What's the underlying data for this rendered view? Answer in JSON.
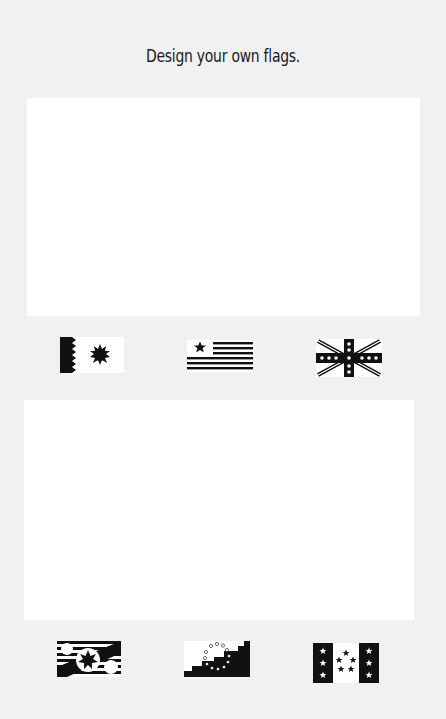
{
  "page": {
    "title": "Design your own flags.",
    "background_color": "#f1f1f1",
    "panel_color": "#ffffff",
    "ink_color": "#111111"
  },
  "panels": [
    {
      "id": "drawing-area-1",
      "label": ""
    },
    {
      "id": "drawing-area-2",
      "label": ""
    }
  ],
  "flags_row1": [
    {
      "name": "serrated-edge-sun-flag",
      "description": "Black serrated hoist with black sunburst"
    },
    {
      "name": "stripes-single-star-flag",
      "description": "Horizontal black stripes with star in canton"
    },
    {
      "name": "union-jack-stars-flag",
      "description": "Saltire cross with stars along the cross"
    }
  ],
  "flags_row2": [
    {
      "name": "diagonal-stars-flag",
      "description": "Striped flag with diagonal band and three stars"
    },
    {
      "name": "stepped-ring-of-dots-flag",
      "description": "Stepped black field with ring of dots"
    },
    {
      "name": "vertical-bands-stars-flag",
      "description": "Two black vertical bands with stars and a star circle"
    }
  ]
}
